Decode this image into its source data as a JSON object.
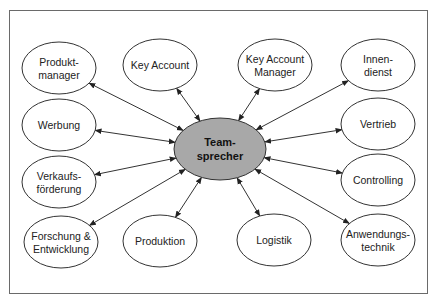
{
  "diagram": {
    "center": {
      "id": "teamsprecher",
      "lines": [
        "Team-",
        "sprecher"
      ],
      "cx": 220,
      "cy": 149,
      "rx": 46,
      "ry": 31,
      "fill": "#a8a8a8"
    },
    "nodes": [
      {
        "id": "produktmanager",
        "lines": [
          "Produkt-",
          "manager"
        ],
        "cx": 59,
        "cy": 68,
        "rx": 37,
        "ry": 26
      },
      {
        "id": "key-account",
        "lines": [
          "Key Account"
        ],
        "cx": 160,
        "cy": 65,
        "rx": 37,
        "ry": 26
      },
      {
        "id": "key-account-manager",
        "lines": [
          "Key Account",
          "Manager"
        ],
        "cx": 275,
        "cy": 65,
        "rx": 37,
        "ry": 26
      },
      {
        "id": "innendienst",
        "lines": [
          "Innen-",
          "dienst"
        ],
        "cx": 378,
        "cy": 65,
        "rx": 37,
        "ry": 26
      },
      {
        "id": "werbung",
        "lines": [
          "Werbung"
        ],
        "cx": 59,
        "cy": 125,
        "rx": 37,
        "ry": 26
      },
      {
        "id": "vertrieb",
        "lines": [
          "Vertrieb"
        ],
        "cx": 378,
        "cy": 124,
        "rx": 37,
        "ry": 26
      },
      {
        "id": "verkaufsfoerderung",
        "lines": [
          "Verkaufs-",
          "förderung"
        ],
        "cx": 59,
        "cy": 182,
        "rx": 37,
        "ry": 26
      },
      {
        "id": "controlling",
        "lines": [
          "Controlling"
        ],
        "cx": 378,
        "cy": 180,
        "rx": 37,
        "ry": 26
      },
      {
        "id": "forschung-entwicklung",
        "lines": [
          "Forschung &",
          "Entwicklung"
        ],
        "cx": 61,
        "cy": 242,
        "rx": 37,
        "ry": 26
      },
      {
        "id": "produktion",
        "lines": [
          "Produktion"
        ],
        "cx": 160,
        "cy": 241,
        "rx": 37,
        "ry": 26
      },
      {
        "id": "logistik",
        "lines": [
          "Logistik"
        ],
        "cx": 274,
        "cy": 240,
        "rx": 37,
        "ry": 26
      },
      {
        "id": "anwendungstechnik",
        "lines": [
          "Anwendungs-",
          "technik"
        ],
        "cx": 378,
        "cy": 240,
        "rx": 37,
        "ry": 26
      }
    ],
    "edges": [
      {
        "from": "teamsprecher",
        "to": "produktmanager",
        "type": "bidirectional"
      },
      {
        "from": "teamsprecher",
        "to": "key-account",
        "type": "bidirectional"
      },
      {
        "from": "teamsprecher",
        "to": "key-account-manager",
        "type": "bidirectional"
      },
      {
        "from": "teamsprecher",
        "to": "innendienst",
        "type": "bidirectional"
      },
      {
        "from": "teamsprecher",
        "to": "werbung",
        "type": "bidirectional"
      },
      {
        "from": "teamsprecher",
        "to": "vertrieb",
        "type": "bidirectional"
      },
      {
        "from": "teamsprecher",
        "to": "verkaufsfoerderung",
        "type": "bidirectional"
      },
      {
        "from": "teamsprecher",
        "to": "controlling",
        "type": "bidirectional"
      },
      {
        "from": "teamsprecher",
        "to": "forschung-entwicklung",
        "type": "bidirectional"
      },
      {
        "from": "teamsprecher",
        "to": "produktion",
        "type": "bidirectional"
      },
      {
        "from": "teamsprecher",
        "to": "logistik",
        "type": "bidirectional"
      },
      {
        "from": "teamsprecher",
        "to": "anwendungstechnik",
        "type": "bidirectional"
      }
    ],
    "style": {
      "node_fill": "#ffffff",
      "stroke": "#333333",
      "frame": "#6a6a6a"
    }
  }
}
